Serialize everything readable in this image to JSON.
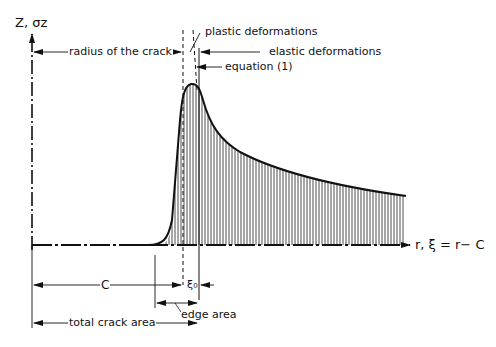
{
  "diagram": {
    "y_axis_label": "Z, σz",
    "x_axis_label": "r, ξ = r− C",
    "annotations": {
      "radius_of_crack": "radius of the crack",
      "plastic_deformations": "plastic deformations",
      "elastic_deformations": "elastic deformations",
      "equation": "equation (1)",
      "c_label": "C",
      "xi0_label": "ξ₀",
      "edge_area": "edge area",
      "total_crack_area": "total crack area"
    },
    "colors": {
      "ink": "#111111",
      "background": "#ffffff"
    }
  }
}
